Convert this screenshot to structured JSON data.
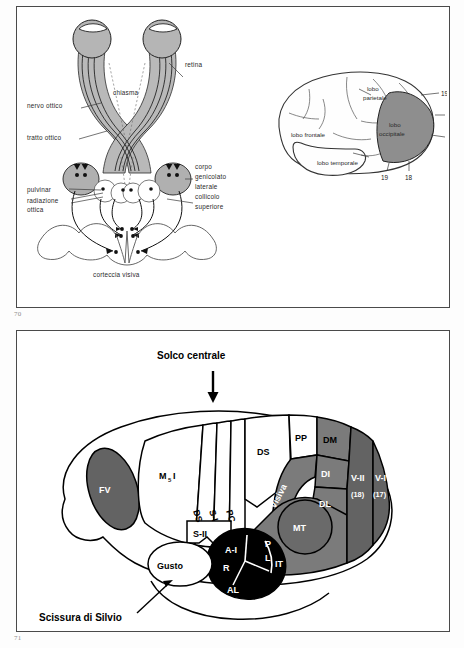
{
  "document": {
    "folio_top": "70",
    "folio_bottom": "71"
  },
  "figure_top": {
    "visual_pathway": {
      "labels": {
        "retina": "retina",
        "optic_nerve": "nervo ottico",
        "chiasm": "chiasma",
        "optic_tract": "tratto ottico",
        "lgn": "corpo\ngenicolato\nlaterale",
        "lgn_line1": "corpo",
        "lgn_line2": "genicolato",
        "lgn_line3": "laterale",
        "pulvinar": "pulvinar",
        "optic_radiation_line1": "radiazione",
        "optic_radiation_line2": "ottica",
        "superior_colliculus_line1": "collicolo",
        "superior_colliculus_line2": "superiore",
        "visual_cortex": "corteccia visiva"
      }
    },
    "lateral_brain": {
      "labels": {
        "frontal_lobe": "lobo frontale",
        "parietal_lobe_line1": "lobo",
        "parietal_lobe_line2": "parietale",
        "temporal_lobe": "lobo temporale",
        "occipital_lobe_line1": "lobo",
        "occipital_lobe_line2": "occipitale"
      },
      "brodmann_right": [
        "19",
        "18",
        "17"
      ],
      "brodmann_bottom": [
        "19",
        "18"
      ]
    }
  },
  "figure_bottom": {
    "callouts": {
      "central_sulcus": "Solco centrale",
      "sylvian_fissure": "Scissura di Silvio"
    },
    "areas": [
      {
        "code": "FV",
        "shade": "dark"
      },
      {
        "code": "M₅I",
        "shade": "white"
      },
      {
        "code": "DS",
        "shade": "white"
      },
      {
        "code": "S-I",
        "shade": "white"
      },
      {
        "code": "PC",
        "shade": "white"
      },
      {
        "code": "DS",
        "shade": "white"
      },
      {
        "code": "PP",
        "shade": "white"
      },
      {
        "code": "DM",
        "shade": "mid"
      },
      {
        "code": "S-II",
        "shade": "white"
      },
      {
        "code": "A-I",
        "shade": "black"
      },
      {
        "code": "R",
        "shade": "black"
      },
      {
        "code": "AL",
        "shade": "black"
      },
      {
        "code": "P",
        "shade": "black"
      },
      {
        "code": "L",
        "shade": "black"
      },
      {
        "code": "Gusto",
        "shade": "white"
      },
      {
        "code": "Visiva",
        "shade": "mid"
      },
      {
        "code": "DI",
        "shade": "mid"
      },
      {
        "code": "DL",
        "shade": "mid"
      },
      {
        "code": "MT",
        "shade": "mid"
      },
      {
        "code": "IT",
        "shade": "mid"
      },
      {
        "code": "V-II",
        "shade": "dark",
        "brodmann": "(18)"
      },
      {
        "code": "V-I",
        "shade": "dark",
        "brodmann": "(17)"
      }
    ],
    "area_labels": {
      "fv": "FV",
      "m5i_base": "M",
      "m5i_sub": "5",
      "m5i_tail": "I",
      "ds_strip": "DS",
      "s1": "S-I",
      "pc": "PC",
      "ds_top": "DS",
      "pp": "PP",
      "dm": "DM",
      "s2": "S-II",
      "a1": "A-I",
      "r": "R",
      "al": "AL",
      "p": "P",
      "l": "L",
      "gusto": "Gusto",
      "visiva": "Visiva",
      "di": "DI",
      "dl": "DL",
      "mt": "MT",
      "it": "IT",
      "v2": "V-II",
      "v2_num": "(18)",
      "v1": "V-I",
      "v1_num": "(17)"
    }
  },
  "colors": {
    "ink": "#111111",
    "panel_border": "#4a4a4a",
    "shade_light": "#b5b5b5",
    "shade_mid": "#7b7b7b",
    "shade_dark": "#636363",
    "shade_black": "#000000",
    "paper": "#ffffff"
  }
}
